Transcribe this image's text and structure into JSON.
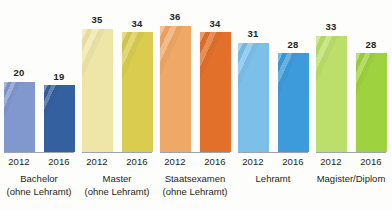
{
  "chart_data": {
    "type": "bar",
    "title": "",
    "subtitle": "",
    "xlabel": "",
    "ylabel": "",
    "ylim": [
      0,
      40
    ],
    "grid": false,
    "legend": "none",
    "categories": [
      "Bachelor (ohne Lehramt)",
      "Master (ohne Lehramt)",
      "Staatsexamen (ohne Lehramt)",
      "Lehramt",
      "Magister/Diplom"
    ],
    "series": [
      {
        "name": "2012",
        "values": [
          20,
          35,
          36,
          31,
          33
        ]
      },
      {
        "name": "2016",
        "values": [
          19,
          34,
          34,
          28,
          28
        ]
      }
    ]
  },
  "groups": [
    {
      "name": "bachelor",
      "label_line1": "Bachelor",
      "label_line2": "(ohne Lehramt)",
      "bars": [
        {
          "year": "2012",
          "value": "20",
          "color": "#8198ce"
        },
        {
          "year": "2016",
          "value": "19",
          "color": "#35609f"
        }
      ]
    },
    {
      "name": "master",
      "label_line1": "Master",
      "label_line2": "(ohne Lehramt)",
      "bars": [
        {
          "year": "2012",
          "value": "35",
          "color": "#eee6a6"
        },
        {
          "year": "2016",
          "value": "34",
          "color": "#d9cc4f"
        }
      ]
    },
    {
      "name": "staatsexamen",
      "label_line1": "Staatsexamen",
      "label_line2": "(ohne Lehramt)",
      "bars": [
        {
          "year": "2012",
          "value": "36",
          "color": "#f0a866"
        },
        {
          "year": "2016",
          "value": "34",
          "color": "#e2702a"
        }
      ]
    },
    {
      "name": "lehramt",
      "label_line1": "Lehramt",
      "label_line2": "",
      "bars": [
        {
          "year": "2012",
          "value": "31",
          "color": "#7cc0ea"
        },
        {
          "year": "2016",
          "value": "28",
          "color": "#3d9bdc"
        }
      ]
    },
    {
      "name": "magister-diplom",
      "label_line1": "Magister/Diplom",
      "label_line2": "",
      "bars": [
        {
          "year": "2012",
          "value": "33",
          "color": "#bbdf6a"
        },
        {
          "year": "2016",
          "value": "28",
          "color": "#9ed23f"
        }
      ]
    }
  ],
  "style": {
    "background": "#fdfdfb",
    "text_color": "#231f20",
    "baseline_color": "#9aa4ac",
    "px_per_unit": 3.52,
    "group_width": 78,
    "group_left": [
      0,
      78,
      156,
      234,
      312
    ]
  }
}
